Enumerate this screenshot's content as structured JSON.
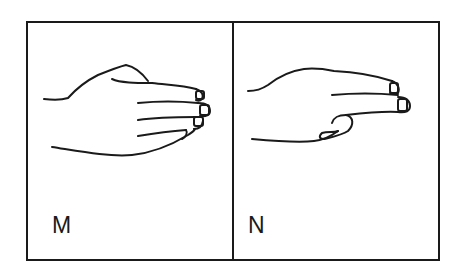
{
  "figure": {
    "panels": [
      {
        "letter": "M",
        "icon": "hand-sign-m-icon"
      },
      {
        "letter": "N",
        "icon": "hand-sign-n-icon"
      }
    ]
  },
  "colors": {
    "line": "#1a1a1a",
    "background": "#ffffff"
  }
}
